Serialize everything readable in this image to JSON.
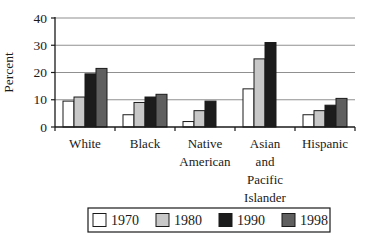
{
  "chart_data": {
    "type": "bar",
    "title": "",
    "xlabel": "",
    "ylabel": "Percent",
    "ylim": [
      0,
      40
    ],
    "yticks": [
      0,
      10,
      20,
      30,
      40
    ],
    "grid": true,
    "legend_position": "bottom",
    "categories": [
      "White",
      "Black",
      "Native American",
      "Asian and Pacific Islander",
      "Hispanic"
    ],
    "category_label_lines": [
      [
        "White"
      ],
      [
        "Black"
      ],
      [
        "Native",
        "American"
      ],
      [
        "Asian",
        "and",
        "Pacific",
        "Islander"
      ],
      [
        "Hispanic"
      ]
    ],
    "series": [
      {
        "name": "1970",
        "color": "#ffffff",
        "values": [
          9.5,
          4.5,
          2,
          14,
          4.5
        ]
      },
      {
        "name": "1980",
        "color": "#c8c8c8",
        "values": [
          11,
          9,
          6,
          25,
          6
        ]
      },
      {
        "name": "1990",
        "color": "#1c1c1c",
        "values": [
          19.5,
          11,
          9.5,
          31,
          8
        ]
      },
      {
        "name": "1998",
        "color": "#5f5f5f",
        "values": [
          21.5,
          12,
          null,
          null,
          10.5
        ]
      }
    ]
  },
  "colors": {
    "axis": "#1a1a1a",
    "grid": "#909090",
    "background": "#ffffff",
    "bar_stroke": "#1a1a1a",
    "legend_border": "#1a1a1a"
  }
}
